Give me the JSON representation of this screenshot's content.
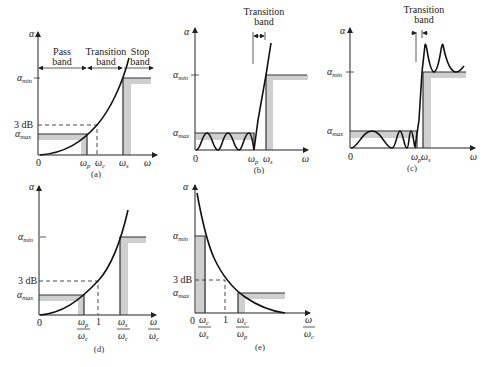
{
  "figure": {
    "panels": [
      {
        "id": "a",
        "caption": "(a)",
        "y_axis_label": "α",
        "x_axis_label": "ω",
        "y_ticks": [
          "α_min",
          "3 dB",
          "α_max"
        ],
        "x_ticks": [
          "0",
          "ω_p",
          "ω_c",
          "ω_s"
        ],
        "bands": [
          "Pass band",
          "Transition band",
          "Stop band"
        ],
        "response": "monotonic increasing (Butterworth-like)"
      },
      {
        "id": "b",
        "caption": "(b)",
        "y_axis_label": "α",
        "x_axis_label": "ω",
        "y_ticks": [
          "α_min",
          "α_max"
        ],
        "x_ticks": [
          "0",
          "ω_p",
          "ω_s"
        ],
        "bands": [
          "Transition band"
        ],
        "response": "equiripple passband, monotonic stopband (Chebyshev)"
      },
      {
        "id": "c",
        "caption": "(c)",
        "y_axis_label": "α",
        "x_axis_label": "ω",
        "y_ticks": [
          "α_min",
          "α_max"
        ],
        "x_ticks": [
          "0",
          "ω_p",
          "ω_s"
        ],
        "bands": [
          "Transition band"
        ],
        "response": "equiripple passband and stopband (elliptic)"
      },
      {
        "id": "d",
        "caption": "(d)",
        "y_axis_label": "α",
        "x_axis_label": "ω/ω_c",
        "y_ticks": [
          "α_min",
          "3 dB",
          "α_max"
        ],
        "x_ticks": [
          "0",
          "ω_p/ω_c",
          "1",
          "ω_s/ω_c"
        ],
        "response": "normalized lowpass"
      },
      {
        "id": "e",
        "caption": "(e)",
        "y_axis_label": "α",
        "x_axis_label": "ω/ω_c",
        "y_ticks": [
          "α_min",
          "3 dB",
          "α_max"
        ],
        "x_ticks": [
          "0",
          "ω_c/ω_s",
          "1",
          "ω_c/ω_p"
        ],
        "response": "normalized highpass (decreasing)"
      }
    ]
  },
  "text": {
    "alpha": "α",
    "omega": "ω",
    "min": "min",
    "max": "max",
    "p": "p",
    "s": "s",
    "c": "c",
    "zero": "0",
    "one": "1",
    "three_db": "3 dB",
    "pass": "Pass",
    "transition": "Transition",
    "stop": "Stop",
    "band": "band",
    "cap_a": "(a)",
    "cap_b": "(b)",
    "cap_c": "(c)",
    "cap_d": "(d)",
    "cap_e": "(e)"
  }
}
